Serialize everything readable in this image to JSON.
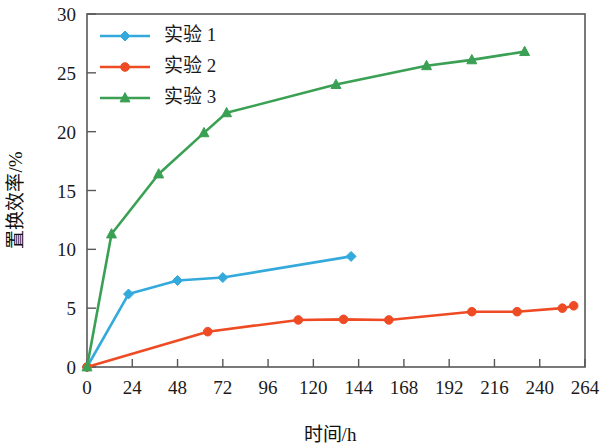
{
  "chart_data": {
    "type": "line",
    "title": "",
    "xlabel": "时间/h",
    "ylabel": "置换效率/%",
    "xlim": [
      0,
      264
    ],
    "ylim": [
      0,
      30
    ],
    "xticks": [
      0,
      24,
      48,
      72,
      96,
      120,
      144,
      168,
      192,
      216,
      240,
      264
    ],
    "yticks": [
      0,
      5,
      10,
      15,
      20,
      25,
      30
    ],
    "grid": false,
    "legend_position": "top-left",
    "series": [
      {
        "name": "实验 1",
        "color": "#34AADC",
        "marker": "diamond",
        "x": [
          0,
          22,
          48,
          72,
          140
        ],
        "y": [
          0,
          6.2,
          7.35,
          7.6,
          9.4
        ]
      },
      {
        "name": "实验 2",
        "color": "#EE4B24",
        "marker": "circle",
        "x": [
          0,
          64,
          112,
          136,
          160,
          204,
          228,
          252,
          258
        ],
        "y": [
          0,
          3.0,
          4.0,
          4.05,
          4.0,
          4.7,
          4.7,
          5.0,
          5.2
        ]
      },
      {
        "name": "实验 3",
        "color": "#3AA054",
        "marker": "triangle",
        "x": [
          0,
          13,
          38,
          62,
          74,
          132,
          180,
          204,
          232
        ],
        "y": [
          0,
          11.3,
          16.4,
          19.9,
          21.6,
          24.0,
          25.6,
          26.1,
          26.8
        ]
      }
    ]
  },
  "legend": {
    "entries": [
      {
        "label": "实验 1"
      },
      {
        "label": "实验 2"
      },
      {
        "label": "实验 3"
      }
    ]
  },
  "axes": {
    "y_title": "置换效率/%",
    "x_title": "时间/h"
  }
}
